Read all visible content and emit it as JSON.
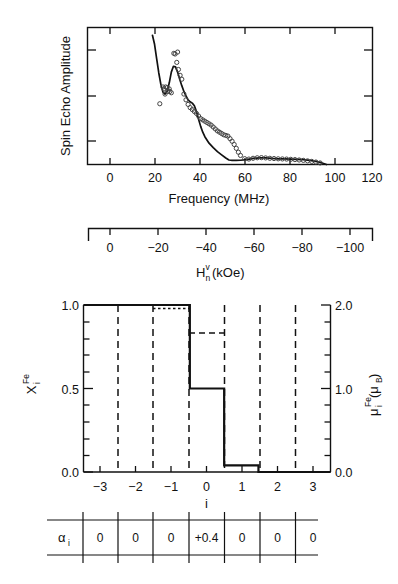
{
  "figure": {
    "panels": [
      "spin-echo-spectrum",
      "site-profile",
      "alpha-table"
    ]
  },
  "top_panel": {
    "ylabel": "Spin Echo Amplitude",
    "xlabel_main": "Frequency",
    "xlabel_unit": "(MHz)",
    "xticks": [
      "0",
      "20",
      "40",
      "60",
      "80",
      "100",
      "120"
    ],
    "secondary_axis": {
      "label_base": "H",
      "label_sup": "v",
      "label_sub": "n",
      "label_unit": "(kOe)",
      "ticks": [
        "0",
        "−20",
        "−40",
        "−60",
        "−80",
        "−100"
      ]
    }
  },
  "bottom_panel": {
    "left_label_base": "X",
    "left_label_sup": "Fe",
    "left_label_sub": "i",
    "right_label_base": "μ",
    "right_label_sup": "Fe",
    "right_label_sub": "i",
    "right_label_unit": "(μ",
    "right_label_unit_sub": "B",
    "right_label_unit_end": ")",
    "left_yticks": [
      "1.0",
      "0.5",
      "0.0"
    ],
    "right_yticks": [
      "2.0",
      "1.0",
      "0.0"
    ],
    "xticks": [
      "−3",
      "−2",
      "−1",
      "0",
      "1",
      "2",
      "3"
    ],
    "xlabel": "i"
  },
  "table": {
    "row_label_base": "α",
    "row_label_sub": "i",
    "values": [
      "0",
      "0",
      "0",
      "+0.4",
      "0",
      "0",
      "0"
    ]
  },
  "chart_data": [
    {
      "type": "line",
      "title": "Spin Echo Amplitude vs Frequency",
      "xlabel": "Frequency (MHz)",
      "ylabel": "Spin Echo Amplitude",
      "xlim": [
        -8,
        128
      ],
      "ylim": [
        0,
        1.06
      ],
      "grid": false,
      "legend": "none",
      "secondary_xaxis": {
        "label": "H_n^v (kOe)",
        "xlim": [
          0,
          -110
        ],
        "ticks": [
          0,
          -20,
          -40,
          -60,
          -80,
          -100
        ]
      },
      "series": [
        {
          "name": "calculated spectrum",
          "style": "solid-line",
          "x": [
            23.0,
            24.0,
            25.0,
            26.0,
            27.0,
            28.0,
            29.0,
            30.0,
            31.0,
            32.0,
            33.0,
            34.0,
            35.0,
            36.0,
            37.0,
            38.0,
            39.0,
            40.0,
            41.0,
            42.0,
            43.0,
            44.0,
            45.0,
            46.0,
            47.0,
            48.0,
            50.0,
            52.0,
            54.0,
            56.0,
            58.0,
            59.5,
            61.0,
            63.0,
            65.0,
            68.0,
            71.0,
            74.0,
            77.0,
            80.0,
            83.0,
            86.0,
            89.0,
            92.0,
            95.0,
            98.0,
            101.0,
            103.0,
            105.0,
            106.0
          ],
          "y": [
            1.0,
            0.93,
            0.82,
            0.71,
            0.62,
            0.56,
            0.545,
            0.565,
            0.63,
            0.715,
            0.76,
            0.755,
            0.715,
            0.66,
            0.61,
            0.565,
            0.53,
            0.5,
            0.485,
            0.475,
            0.455,
            0.41,
            0.35,
            0.295,
            0.25,
            0.215,
            0.165,
            0.13,
            0.1,
            0.075,
            0.05,
            0.035,
            0.032,
            0.032,
            0.033,
            0.038,
            0.047,
            0.052,
            0.051,
            0.047,
            0.044,
            0.043,
            0.042,
            0.04,
            0.037,
            0.032,
            0.024,
            0.016,
            0.006,
            0.0
          ]
        },
        {
          "name": "measured points",
          "style": "open-circles",
          "x": [
            28.0,
            28.5,
            29.3,
            30.0,
            30.3,
            31.0,
            31.3,
            32.0,
            33.2,
            33.8,
            34.6,
            35.4,
            36.2,
            37.0,
            38.0,
            39.0,
            40.0,
            41.0,
            42.0,
            43.0,
            44.0,
            45.0,
            46.0,
            47.0,
            48.0,
            49.0,
            50.0,
            51.0,
            52.0,
            53.0,
            54.0,
            55.0,
            56.0,
            57.0,
            58.0,
            59.0,
            60.0,
            61.0,
            62.0,
            63.0,
            64.0,
            65.0,
            67.0,
            69.0,
            71.0,
            73.0,
            75.0,
            77.0,
            79.0,
            81.0,
            83.0,
            85.0,
            87.0,
            89.0,
            91.0,
            93.0,
            95.0,
            97.0,
            99.0,
            101.0,
            103.0,
            29.0,
            35.0,
            26.5
          ],
          "y": [
            0.6,
            0.585,
            0.6,
            0.595,
            0.565,
            0.585,
            0.565,
            0.555,
            0.86,
            0.855,
            0.79,
            0.735,
            0.69,
            0.66,
            0.545,
            0.5,
            0.465,
            0.44,
            0.425,
            0.41,
            0.395,
            0.375,
            0.355,
            0.345,
            0.335,
            0.325,
            0.315,
            0.305,
            0.29,
            0.275,
            0.26,
            0.25,
            0.24,
            0.23,
            0.225,
            0.22,
            0.2,
            0.18,
            0.155,
            0.125,
            0.095,
            0.07,
            0.045,
            0.042,
            0.048,
            0.052,
            0.053,
            0.051,
            0.048,
            0.046,
            0.044,
            0.043,
            0.042,
            0.04,
            0.038,
            0.035,
            0.032,
            0.028,
            0.024,
            0.019,
            0.012,
            0.545,
            0.87,
            0.47
          ]
        }
      ]
    },
    {
      "type": "bar",
      "title": "Fe site occupation and moment profile",
      "xlabel": "i",
      "ylabel": "X_i^Fe",
      "ylabel_right": "μ_i^Fe (μ_B)",
      "xlim": [
        -3.6,
        3.6
      ],
      "ylim": [
        0.0,
        1.0
      ],
      "ylim_right": [
        0.0,
        2.0
      ],
      "grid": false,
      "categories": [
        -3,
        -2,
        -1,
        0,
        1,
        2,
        3
      ],
      "step_x_edges": [
        -3.6,
        -1.5,
        -0.5,
        0.5,
        1.5,
        3.6
      ],
      "step_values": [
        1.0,
        1.0,
        0.5,
        0.04,
        0.0
      ],
      "values": [
        1.0,
        1.0,
        1.0,
        0.5,
        0.04,
        0.0,
        0.0
      ],
      "dashed_reference": {
        "segment_x": [
          -0.5,
          0.5
        ],
        "segment_y": 0.83,
        "dotted_top_x": [
          -1.5,
          -0.5
        ],
        "dotted_top_y": 0.985
      },
      "vertical_dashed_at": [
        -2.5,
        -1.5,
        -0.5,
        0.5,
        1.5,
        2.5
      ],
      "left_ticks": [
        0.0,
        0.5,
        1.0
      ],
      "right_ticks": [
        0.0,
        1.0,
        2.0
      ]
    },
    {
      "type": "table",
      "title": "alpha_i coefficients",
      "row_labels": [
        "α_i"
      ],
      "columns": [
        -3,
        -2,
        -1,
        0,
        1,
        2,
        3
      ],
      "values": [
        [
          "0",
          "0",
          "0",
          "+0.4",
          "0",
          "0",
          "0"
        ]
      ]
    }
  ]
}
